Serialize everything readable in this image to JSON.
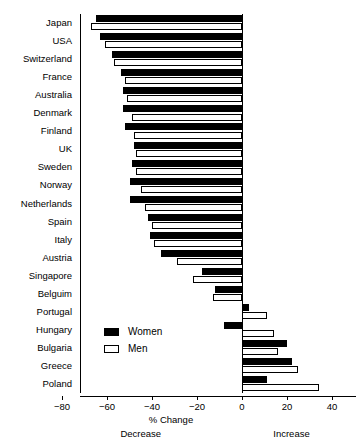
{
  "chart_data": {
    "type": "bar",
    "orientation": "horizontal",
    "title": "",
    "xlabel": "% Change",
    "ylabel": "",
    "xlim": [
      -80,
      40
    ],
    "xticks": [
      -80,
      -60,
      -40,
      -20,
      0,
      20,
      40
    ],
    "xticklabels": [
      "−80",
      "−60",
      "−40",
      "−20",
      "0",
      "20",
      "40"
    ],
    "grid": false,
    "legend_position": "center-left",
    "annotations": [
      {
        "text": "Decrease",
        "x": -45
      },
      {
        "text": "Increase",
        "x": 22
      }
    ],
    "categories": [
      "Japan",
      "USA",
      "Switzerland",
      "France",
      "Australia",
      "Denmark",
      "Finland",
      "UK",
      "Sweden",
      "Norway",
      "Netherlands",
      "Spain",
      "Italy",
      "Austria",
      "Singapore",
      "Belguim",
      "Portugal",
      "Hungary",
      "Bulgaria",
      "Greece",
      "Poland"
    ],
    "series": [
      {
        "name": "Women",
        "color": "#000000",
        "values": [
          -65,
          -63,
          -58,
          -54,
          -53,
          -53,
          -52,
          -48,
          -49,
          -50,
          -50,
          -42,
          -41,
          -36,
          -18,
          -12,
          3,
          -8,
          20,
          22,
          11
        ]
      },
      {
        "name": "Men",
        "color": "#ffffff",
        "values": [
          -67,
          -61,
          -57,
          -52,
          -51,
          -49,
          -48,
          -47,
          -47,
          -45,
          -43,
          -40,
          -39,
          -29,
          -22,
          -13,
          11,
          14,
          16,
          25,
          34
        ]
      }
    ]
  },
  "legend": {
    "items": [
      {
        "label": "Women",
        "swatch": "filled-black-square"
      },
      {
        "label": "Men",
        "swatch": "open-white-square"
      }
    ]
  }
}
